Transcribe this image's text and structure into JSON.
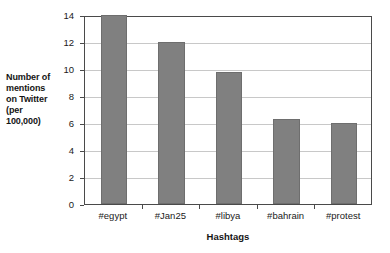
{
  "chart_data": {
    "type": "bar",
    "title": "",
    "subtitle": "",
    "xlabel": "Hashtags",
    "ylabel": "Number of mentions on Twitter (per 100,000)",
    "ylabel_lines": [
      "Number of",
      "mentions",
      "on Twitter",
      "(per",
      "100,000)"
    ],
    "categories": [
      "#egypt",
      "#Jan25",
      "#libya",
      "#bahrain",
      "#protest"
    ],
    "values": [
      14.0,
      12.0,
      9.8,
      6.3,
      6.0
    ],
    "series": [
      {
        "name": "Number of mentions on Twitter (per 100,000)",
        "values": [
          14.0,
          12.0,
          9.8,
          6.3,
          6.0
        ]
      }
    ],
    "ylim": [
      0,
      14
    ],
    "yticks": [
      0,
      2,
      4,
      6,
      8,
      10,
      12,
      14
    ],
    "ytick_labels": [
      "0",
      "2",
      "4",
      "6",
      "8",
      "10",
      "12",
      "14"
    ],
    "grid": true,
    "grid_axis": "y",
    "legend": false,
    "legend_position": "none",
    "bar_color": "#808080",
    "bar_edge_color": "#6e6e6e",
    "grid_color": "#c8c8c8",
    "axis_color": "#4a4a4a",
    "background_color": "#ffffff",
    "annotations": []
  }
}
